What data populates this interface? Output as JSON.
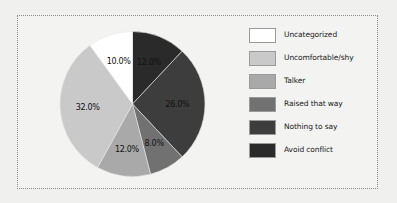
{
  "chart_data": {
    "type": "pie",
    "title": "",
    "categories": [
      "Avoid conflict",
      "Nothing to say",
      "Raised that way",
      "Talker",
      "Uncomfortable/shy",
      "Uncategorized"
    ],
    "values": [
      12.0,
      26.0,
      8.0,
      12.0,
      32.0,
      10.0
    ],
    "labels": [
      "12.0%",
      "26.0%",
      "8.0%",
      "12.0%",
      "32.0%",
      "10.0%"
    ],
    "colors": [
      "#2a2a2a",
      "#3d3d3d",
      "#717171",
      "#a9a9a9",
      "#c9c9c9",
      "#ffffff"
    ],
    "start_angle": "12 o'clock",
    "direction": "clockwise",
    "legend_position": "right"
  },
  "legend": {
    "items": [
      {
        "label": "Uncategorized",
        "color": "#ffffff"
      },
      {
        "label": "Uncomfortable/shy",
        "color": "#c9c9c9"
      },
      {
        "label": "Talker",
        "color": "#a9a9a9"
      },
      {
        "label": "Raised that way",
        "color": "#717171"
      },
      {
        "label": "Nothing to say",
        "color": "#3d3d3d"
      },
      {
        "label": "Avoid conflict",
        "color": "#2a2a2a"
      }
    ]
  }
}
